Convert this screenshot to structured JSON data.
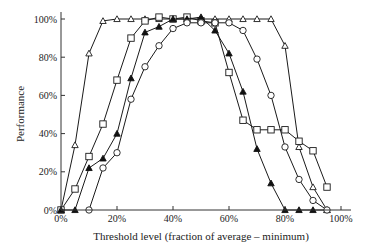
{
  "chart_data": {
    "type": "line",
    "title": "",
    "xlabel": "Threshold level (fraction of average – minimum)",
    "ylabel": "Performance",
    "xlim": [
      0,
      100
    ],
    "ylim": [
      0,
      100
    ],
    "x_ticks": [
      "0%",
      "20%",
      "40%",
      "60%",
      "80%",
      "100%"
    ],
    "y_ticks": [
      "0%",
      "20%",
      "40%",
      "60%",
      "80%",
      "100%"
    ],
    "grid": false,
    "legend": null,
    "series": [
      {
        "name": "open-triangle",
        "marker": "triangle-open",
        "x": [
          0,
          5,
          10,
          15,
          20,
          25,
          30,
          35,
          40,
          45,
          50,
          55,
          60,
          65,
          70,
          75,
          80,
          85,
          90,
          95
        ],
        "y": [
          0,
          34,
          82,
          99,
          100,
          100,
          100,
          100,
          100,
          100,
          100,
          100,
          100,
          100,
          100,
          100,
          86,
          33,
          12,
          0
        ]
      },
      {
        "name": "open-square",
        "marker": "square-open",
        "x": [
          0,
          5,
          10,
          15,
          20,
          25,
          30,
          35,
          40,
          45,
          50,
          55,
          60,
          65,
          70,
          75,
          80,
          85,
          90,
          95
        ],
        "y": [
          0,
          11,
          28,
          45,
          68,
          90,
          99,
          101,
          100,
          101,
          99,
          98,
          72,
          47,
          42,
          42,
          42,
          36,
          31,
          12
        ]
      },
      {
        "name": "filled-triangle",
        "marker": "triangle-filled",
        "x": [
          0,
          5,
          10,
          15,
          20,
          25,
          30,
          35,
          40,
          45,
          50,
          55,
          60,
          65,
          70,
          75,
          80,
          85,
          90,
          95
        ],
        "y": [
          0,
          0,
          22,
          27,
          40,
          69,
          93,
          96,
          100,
          100,
          101,
          94,
          82,
          62,
          32,
          14,
          0,
          0,
          0,
          0
        ]
      },
      {
        "name": "open-circle",
        "marker": "circle-open",
        "x": [
          10,
          15,
          20,
          25,
          30,
          35,
          40,
          45,
          50,
          55,
          60,
          65,
          70,
          75,
          80,
          85,
          90,
          95
        ],
        "y": [
          0,
          22,
          30,
          58,
          75,
          86,
          95,
          98,
          98,
          98,
          98,
          94,
          79,
          60,
          33,
          16,
          5,
          0
        ]
      }
    ]
  }
}
